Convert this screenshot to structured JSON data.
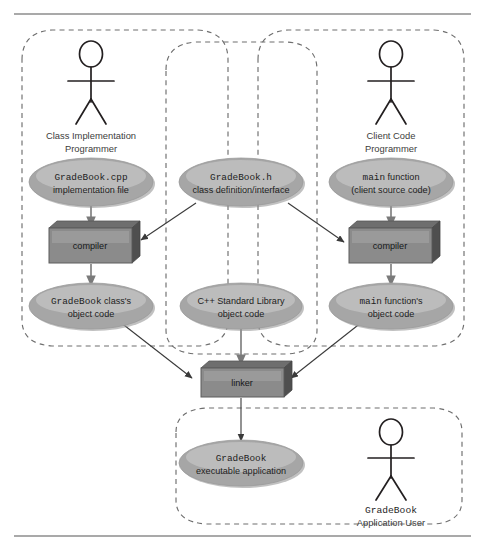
{
  "figure": {
    "type": "uml-like process diagram",
    "background_color": "#ffffff",
    "rule_color": "#8d8d8d"
  },
  "palette": {
    "ellipse_fill": "#a6a6a6",
    "ellipse_highlight": "#bcbcbc",
    "box_front": "#8b8b8b",
    "box_top": "#6e6e6e",
    "box_side": "#4f4f4f",
    "dashed_region": "#6e6e6e",
    "arrow_dark": "#3a3a3a",
    "arrow_gray": "#7a7a7a",
    "text": "#231f20"
  },
  "regions": [
    {
      "id": "class-implementation-region",
      "label": ""
    },
    {
      "id": "class-interface-region",
      "label": ""
    },
    {
      "id": "client-code-region",
      "label": ""
    },
    {
      "id": "application-user-region",
      "label": ""
    }
  ],
  "actors": [
    {
      "id": "class-implementation-programmer",
      "line1": "Class Implementation",
      "line2": "Programmer"
    },
    {
      "id": "client-code-programmer",
      "line1": "Client Code",
      "line2": "Programmer"
    },
    {
      "id": "gradebook-application-user",
      "line1": "GradeBook",
      "line1_mono": true,
      "line2": "Application User"
    }
  ],
  "nodes": {
    "gradebook_cpp": {
      "line1_mono": "GradeBook.cpp",
      "line2": "implementation file"
    },
    "gradebook_h": {
      "line1_mono": "GradeBook.h",
      "line2": "class definition/interface"
    },
    "main_source": {
      "line1_mono": "main",
      "line1_rest": " function",
      "line2": "(client source code)"
    },
    "compiler_left": {
      "label": "compiler"
    },
    "compiler_right": {
      "label": "compiler"
    },
    "gradebook_object": {
      "line1_mono": "GradeBook",
      "line1_rest": " class's",
      "line2": "object code"
    },
    "stdlib_object": {
      "line1": "C++ Standard Library",
      "line2": "object code"
    },
    "main_object": {
      "line1_mono": "main",
      "line1_rest": " function's",
      "line2": "object code"
    },
    "linker": {
      "label": "linker"
    },
    "gradebook_executable": {
      "line1_mono": "GradeBook",
      "line2": "executable application"
    }
  },
  "edges": [
    {
      "from": "gradebook_cpp",
      "to": "compiler_left",
      "style": "gray"
    },
    {
      "from": "gradebook_h",
      "to": "compiler_left",
      "style": "dark"
    },
    {
      "from": "gradebook_h",
      "to": "compiler_right",
      "style": "dark"
    },
    {
      "from": "main_source",
      "to": "compiler_right",
      "style": "gray"
    },
    {
      "from": "compiler_left",
      "to": "gradebook_object",
      "style": "gray"
    },
    {
      "from": "compiler_right",
      "to": "main_object",
      "style": "gray"
    },
    {
      "from": "gradebook_object",
      "to": "linker",
      "style": "dark"
    },
    {
      "from": "stdlib_object",
      "to": "linker",
      "style": "gray"
    },
    {
      "from": "main_object",
      "to": "linker",
      "style": "dark"
    },
    {
      "from": "linker",
      "to": "gradebook_executable",
      "style": "dark"
    }
  ]
}
